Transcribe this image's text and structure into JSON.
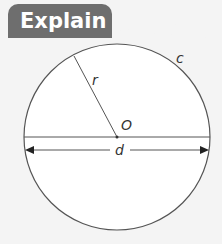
{
  "header": {
    "title": "Explain"
  },
  "diagram": {
    "shape": "circle",
    "labels": {
      "center": "O",
      "radius": "r",
      "diameter": "d",
      "circumference": "c"
    },
    "colors": {
      "tab": "#6e6e6e",
      "line": "#444444",
      "background": "#f4f4f4"
    }
  }
}
